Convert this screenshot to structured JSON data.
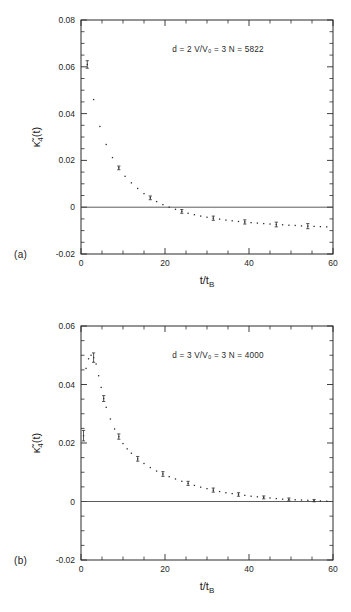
{
  "figure": {
    "panels": [
      {
        "tag": "(a)",
        "annotation": "d = 2   V/V₀ = 3   N = 5822",
        "annotation_parts": {
          "d": "d = 2",
          "ratio": "V/V₀ = 3",
          "n": "N = 5822"
        },
        "chart_data": {
          "type": "scatter",
          "title": "",
          "xlabel": "t/t_B",
          "ylabel": "κ̃4(t)",
          "xlim": [
            0,
            60
          ],
          "ylim": [
            -0.02,
            0.08
          ],
          "xticks": [
            0,
            20,
            40,
            60
          ],
          "xtick_labels": [
            "0",
            "20",
            "40",
            "60"
          ],
          "xminor_step": 5,
          "yticks": [
            -0.02,
            0,
            0.02,
            0.04,
            0.06,
            0.08
          ],
          "ytick_labels": [
            "-0.02",
            "0",
            "0.02",
            "0.04",
            "0.06",
            "0.08"
          ],
          "yminor_step": 0.005,
          "grid": false,
          "legend": null,
          "zero_reference_line": 0,
          "series": [
            {
              "name": "κ̃4(t) d=2",
              "x": [
                1.5,
                3.0,
                4.5,
                6.0,
                7.5,
                9.0,
                10.5,
                12.0,
                13.5,
                15.0,
                16.5,
                18.0,
                19.5,
                21.0,
                22.5,
                24.0,
                25.5,
                27.0,
                28.5,
                30.0,
                31.5,
                33.0,
                34.5,
                36.0,
                37.5,
                39.0,
                40.5,
                42.0,
                43.5,
                45.0,
                46.5,
                48.0,
                49.5,
                51.0,
                52.5,
                54.0,
                55.5,
                57.0,
                58.5
              ],
              "y": [
                0.061,
                0.046,
                0.0345,
                0.0268,
                0.0212,
                0.0168,
                0.0132,
                0.0104,
                0.008,
                0.0058,
                0.004,
                0.0024,
                0.0011,
                0.0,
                -0.0009,
                -0.0018,
                -0.0026,
                -0.0032,
                -0.0038,
                -0.0043,
                -0.0047,
                -0.0051,
                -0.0055,
                -0.0058,
                -0.0061,
                -0.0063,
                -0.0066,
                -0.0068,
                -0.007,
                -0.0072,
                -0.0074,
                -0.0075,
                -0.0077,
                -0.0078,
                -0.008,
                -0.0081,
                -0.0082,
                -0.0083,
                -0.0084
              ],
              "yerr": [
                0.0016,
                0.0011,
                0.0009,
                0.0008,
                0.0008,
                0.0008,
                0.0008,
                0.0008,
                0.0008,
                0.0008,
                0.0008,
                0.0008,
                0.0008,
                0.0008,
                0.0008,
                0.0008,
                0.0008,
                0.0008,
                0.0008,
                0.0008,
                0.0009,
                0.0009,
                0.0009,
                0.0009,
                0.0009,
                0.0009,
                0.001,
                0.001,
                0.001,
                0.001,
                0.001,
                0.001,
                0.0011,
                0.0011,
                0.0011,
                0.0011,
                0.0011,
                0.0012,
                0.0012
              ],
              "errbar_every": 5
            }
          ]
        }
      },
      {
        "tag": "(b)",
        "annotation": "d = 3   V/V₀ = 3   N = 4000",
        "annotation_parts": {
          "d": "d = 3",
          "ratio": "V/V₀ = 3",
          "n": "N = 4000"
        },
        "chart_data": {
          "type": "scatter",
          "title": "",
          "xlabel": "t/t_B",
          "ylabel": "κ̃4(t)",
          "xlim": [
            0,
            60
          ],
          "ylim": [
            -0.02,
            0.06
          ],
          "xticks": [
            0,
            20,
            40,
            60
          ],
          "xtick_labels": [
            "0",
            "20",
            "40",
            "60"
          ],
          "xminor_step": 5,
          "yticks": [
            -0.02,
            0,
            0.02,
            0.04,
            0.06
          ],
          "ytick_labels": [
            "-0.02",
            "0",
            "0.02",
            "0.04",
            "0.06"
          ],
          "yminor_step": 0.005,
          "grid": false,
          "legend": null,
          "zero_reference_line": 0,
          "series": [
            {
              "name": "κ̃4(t) d=3",
              "x": [
                0.6,
                1.2,
                1.8,
                2.4,
                3.0,
                3.6,
                4.2,
                4.8,
                5.4,
                6.0,
                7.0,
                8.0,
                9.0,
                10.0,
                11.0,
                12.0,
                13.5,
                15.0,
                16.5,
                18.0,
                19.5,
                21.0,
                22.5,
                24.0,
                25.5,
                27.0,
                28.5,
                30.0,
                31.5,
                33.0,
                34.5,
                36.0,
                37.5,
                39.0,
                40.5,
                42.0,
                43.5,
                45.0,
                46.5,
                48.0,
                49.5,
                51.0,
                52.5,
                54.0,
                55.5,
                57.0,
                58.5
              ],
              "y": [
                0.0225,
                0.0455,
                0.0488,
                0.05,
                0.0492,
                0.047,
                0.043,
                0.039,
                0.0352,
                0.0322,
                0.0282,
                0.0248,
                0.0222,
                0.0198,
                0.018,
                0.0165,
                0.0146,
                0.013,
                0.0116,
                0.0104,
                0.0094,
                0.0085,
                0.0077,
                0.0069,
                0.0062,
                0.0055,
                0.0049,
                0.0044,
                0.0039,
                0.0034,
                0.003,
                0.0027,
                0.0024,
                0.0021,
                0.0018,
                0.0016,
                0.0014,
                0.0012,
                0.001,
                0.0008,
                0.0007,
                0.0006,
                0.0005,
                0.0004,
                0.0003,
                0.0002,
                0.0001
              ],
              "yerr": [
                0.0018,
                0.0022,
                0.002,
                0.0018,
                0.0016,
                0.0014,
                0.0012,
                0.0011,
                0.001,
                0.001,
                0.0009,
                0.0009,
                0.0009,
                0.0008,
                0.0008,
                0.0008,
                0.0008,
                0.0008,
                0.0008,
                0.0008,
                0.0008,
                0.0008,
                0.0007,
                0.0007,
                0.0007,
                0.0007,
                0.0007,
                0.0007,
                0.0007,
                0.0006,
                0.0006,
                0.0006,
                0.0006,
                0.0006,
                0.0006,
                0.0006,
                0.0005,
                0.0005,
                0.0005,
                0.0005,
                0.0005,
                0.0005,
                0.0004,
                0.0004,
                0.0004,
                0.0004,
                0.0004
              ],
              "errbar_every": 4
            }
          ]
        }
      }
    ]
  },
  "style": {
    "ink": "#2b2b2b",
    "background": "#ffffff"
  }
}
